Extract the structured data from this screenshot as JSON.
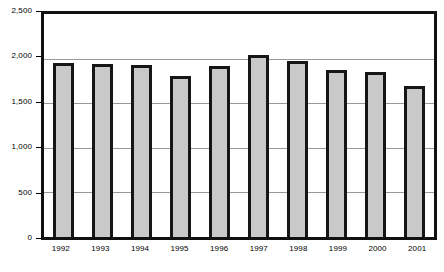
{
  "chart_data": {
    "type": "bar",
    "title": "",
    "subtitle": "",
    "xlabel": "",
    "ylabel": "",
    "categories": [
      "1992",
      "1993",
      "1994",
      "1995",
      "1996",
      "1997",
      "1998",
      "1999",
      "2000",
      "2001"
    ],
    "values": [
      1950,
      1940,
      1930,
      1800,
      1920,
      2040,
      1970,
      1870,
      1850,
      1690
    ],
    "series": [
      {
        "name": "",
        "values": [
          1950,
          1940,
          1930,
          1800,
          1920,
          2040,
          1970,
          1870,
          1850,
          1690
        ]
      }
    ],
    "ylim": [
      0,
      2500
    ],
    "ytick_values": [
      0,
      500,
      1000,
      1500,
      2000,
      2500
    ],
    "ytick_labels": [
      "0",
      "500",
      "1,000",
      "1,500",
      "2,000",
      "2,500"
    ],
    "grid": true,
    "grid_axis": "y",
    "legend": false,
    "legend_position": "none",
    "annotations": [],
    "colors": {
      "bar_fill": "#c9c9c9",
      "bar_border": "#161616",
      "gridline": "#9a9a9a",
      "frame": "#111111",
      "background": "#ffffff",
      "text": "#000000"
    }
  }
}
